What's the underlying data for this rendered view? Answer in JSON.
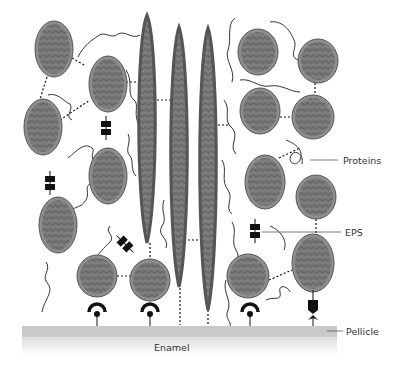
{
  "diagram": {
    "type": "biofilm-cross-section",
    "labels": {
      "proteins": "Proteins",
      "eps": "EPS",
      "pellicle": "Pellicle",
      "enamel": "Enamel"
    },
    "colors": {
      "cell_fill": "#7a7a7a",
      "cell_rim": "#8e8e8e",
      "cell_outline": "#555555",
      "pellicle": "#c9c9c9",
      "enamel_fade": "#e6e6e6",
      "link": "#111111",
      "background": "#ffffff"
    },
    "cells": [
      {
        "cx": 54,
        "cy": 49,
        "rx": 19,
        "ry": 28
      },
      {
        "cx": 108,
        "cy": 84,
        "rx": 19,
        "ry": 28
      },
      {
        "cx": 43,
        "cy": 127,
        "rx": 19,
        "ry": 28
      },
      {
        "cx": 108,
        "cy": 176,
        "rx": 19,
        "ry": 28
      },
      {
        "cx": 58,
        "cy": 225,
        "rx": 19,
        "ry": 28
      },
      {
        "cx": 97,
        "cy": 276,
        "rx": 20,
        "ry": 21
      },
      {
        "cx": 150,
        "cy": 280,
        "rx": 20,
        "ry": 21
      },
      {
        "cx": 258,
        "cy": 52,
        "rx": 20,
        "ry": 23
      },
      {
        "cx": 318,
        "cy": 61,
        "rx": 20,
        "ry": 22
      },
      {
        "cx": 260,
        "cy": 111,
        "rx": 20,
        "ry": 23
      },
      {
        "cx": 313,
        "cy": 117,
        "rx": 21,
        "ry": 22
      },
      {
        "cx": 265,
        "cy": 182,
        "rx": 20,
        "ry": 27
      },
      {
        "cx": 316,
        "cy": 197,
        "rx": 20,
        "ry": 22
      },
      {
        "cx": 248,
        "cy": 276,
        "rx": 21,
        "ry": 22
      },
      {
        "cx": 313,
        "cy": 263,
        "rx": 21,
        "ry": 29
      }
    ],
    "rods": [
      {
        "cx": 147,
        "top": 15,
        "bottom": 243,
        "w": 21
      },
      {
        "cx": 179,
        "top": 27,
        "bottom": 287,
        "w": 20
      },
      {
        "cx": 208,
        "top": 28,
        "bottom": 310,
        "w": 20
      }
    ],
    "adhesins": [
      {
        "x": 97,
        "type": "arc"
      },
      {
        "x": 150,
        "type": "arc"
      },
      {
        "x": 250,
        "type": "arc"
      },
      {
        "x": 313,
        "type": "chevron"
      }
    ],
    "eps_blocks": [
      {
        "x": 106,
        "y": 128,
        "angle": 0
      },
      {
        "x": 50,
        "y": 183,
        "angle": 0
      },
      {
        "x": 125,
        "y": 244,
        "angle": -45
      },
      {
        "x": 255,
        "y": 231,
        "angle": 0
      }
    ]
  }
}
